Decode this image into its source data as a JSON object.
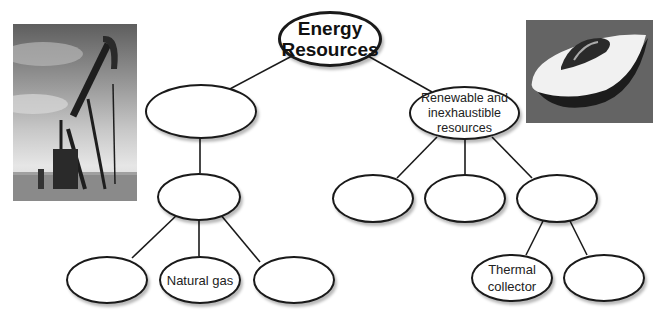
{
  "diagram": {
    "title": "Energy\nResources",
    "nodes": {
      "root": "Energy\nResources",
      "left_branch": "",
      "left_sub": "",
      "left_leaf_1": "",
      "left_leaf_2": "Natural gas",
      "left_leaf_3": "",
      "right_branch": "Renewable and\ninexhaustible\nresources",
      "right_child_1": "",
      "right_child_2": "",
      "right_child_3": "",
      "right_leaf_1": "Thermal\ncollector",
      "right_leaf_2": ""
    },
    "images": {
      "left": "oil-pump-jack-photo",
      "right": "solar-car-photo"
    }
  }
}
